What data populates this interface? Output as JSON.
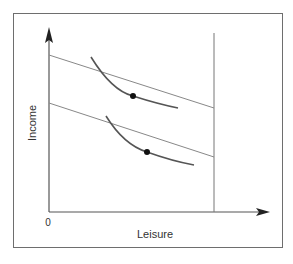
{
  "diagram": {
    "type": "economics-indifference-curves",
    "axes": {
      "x_label": "Leisure",
      "y_label": "Income",
      "origin_label": "0"
    },
    "elements": {
      "budget_lines": [
        {
          "name": "upper-budget-line",
          "from": [
            49,
            55
          ],
          "to": [
            214,
            108
          ]
        },
        {
          "name": "lower-budget-line",
          "from": [
            49,
            103
          ],
          "to": [
            214,
            157
          ]
        }
      ],
      "indifference_curves": [
        {
          "name": "upper-indifference-curve",
          "tangent_point": [
            133,
            96
          ]
        },
        {
          "name": "lower-indifference-curve",
          "tangent_point": [
            147,
            152
          ]
        }
      ],
      "time_endowment_line": {
        "x": 214
      }
    },
    "colors": {
      "frame": "#6e6e6e",
      "axes": "#555555",
      "budget_lines": "#777777",
      "curves": "#555555",
      "points": "#111111",
      "text": "#333333"
    }
  }
}
